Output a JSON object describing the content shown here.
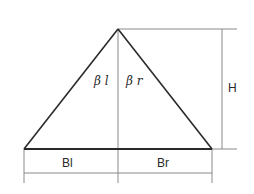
{
  "diagram": {
    "type": "triangle-cross-section",
    "colors": {
      "background": "#ffffff",
      "outline": "#2a2a2a",
      "dimension": "#8a8a8a"
    },
    "labels": {
      "angle_left": "β l",
      "angle_right": "β r",
      "height": "H",
      "base_left": "Bl",
      "base_right": "Br"
    }
  }
}
